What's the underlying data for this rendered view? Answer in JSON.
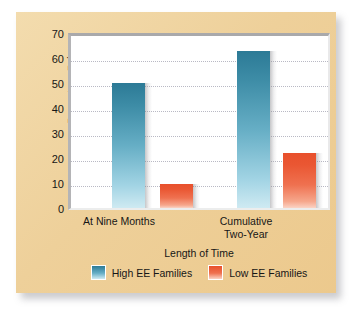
{
  "chart_data": {
    "type": "bar",
    "title": "",
    "xlabel": "Length of Time",
    "ylabel": "Percentage Relapse",
    "categories": [
      "At Nine Months",
      "Cumulative Two-Year"
    ],
    "category_lines": [
      [
        "At Nine Months"
      ],
      [
        "Cumulative",
        "Two-Year"
      ]
    ],
    "series": [
      {
        "name": "High EE Families",
        "color": "#3d8ca6",
        "values": [
          50,
          63
        ]
      },
      {
        "name": "Low EE Families",
        "color": "#ea5733",
        "values": [
          9.5,
          22
        ]
      }
    ],
    "ylim": [
      0,
      70
    ],
    "yticks": [
      70,
      60,
      50,
      40,
      30,
      20,
      10,
      0
    ],
    "ytick_labels": [
      "70",
      "60",
      "50",
      "40",
      "30",
      "20",
      "10",
      "0"
    ],
    "grid": "horizontal-dotted",
    "legend_position": "bottom-center",
    "colors": {
      "card_background": "#eed09a",
      "plot_background": "#ffffff",
      "gridline": "#b9b9c4",
      "text": "#161616"
    }
  },
  "legend": {
    "items": [
      {
        "label": "High EE Families"
      },
      {
        "label": "Low EE Families"
      }
    ]
  }
}
